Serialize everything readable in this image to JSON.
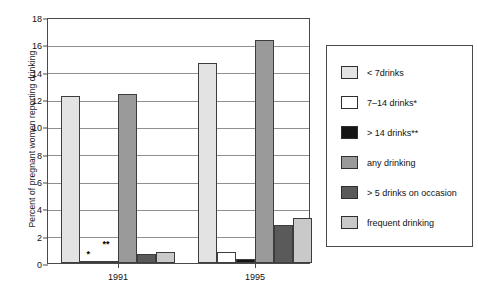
{
  "chart_data": {
    "type": "bar",
    "title": "",
    "xlabel": "",
    "ylabel": "Percent of  pregnant women reporting drinking",
    "ylim": [
      0,
      18
    ],
    "ytick_labels": [
      "0",
      "2",
      "4",
      "6",
      "8",
      "10",
      "12",
      "14",
      "16",
      "18"
    ],
    "ytick_values": [
      0,
      2,
      4,
      6,
      8,
      10,
      12,
      14,
      16,
      18
    ],
    "grid": true,
    "legend_position": "right-outside",
    "categories": [
      "1991",
      "1995"
    ],
    "series": [
      {
        "name": "< 7drinks",
        "values": [
          12.2,
          14.6
        ],
        "color": "#e3e3e3"
      },
      {
        "name": "7–14 drinks*",
        "values": [
          0.05,
          0.8
        ],
        "color": "#ffffff"
      },
      {
        "name": "> 14 drinks**",
        "values": [
          0.1,
          0.3
        ],
        "color": "#151515"
      },
      {
        "name": "any drinking",
        "values": [
          12.4,
          16.3
        ],
        "color": "#9a9a9a"
      },
      {
        "name": "> 5 drinks on occasion",
        "values": [
          0.65,
          2.75
        ],
        "color": "#5a5a5a"
      },
      {
        "name": "frequent drinking",
        "values": [
          0.8,
          3.3
        ],
        "color": "#c9c9c9"
      }
    ],
    "annotations": [
      {
        "text": "*",
        "series": "7–14 drinks*",
        "category": "1991"
      },
      {
        "text": "**",
        "series": "> 14 drinks**",
        "category": "1991"
      }
    ]
  },
  "legend": {
    "items": [
      {
        "label": "< 7drinks",
        "color": "#e3e3e3"
      },
      {
        "label": "7–14 drinks*",
        "color": "#ffffff"
      },
      {
        "label": "> 14 drinks**",
        "color": "#151515"
      },
      {
        "label": "any drinking",
        "color": "#9a9a9a"
      },
      {
        "label": "> 5 drinks on occasion",
        "color": "#5a5a5a"
      },
      {
        "label": "frequent drinking",
        "color": "#c9c9c9"
      }
    ]
  }
}
